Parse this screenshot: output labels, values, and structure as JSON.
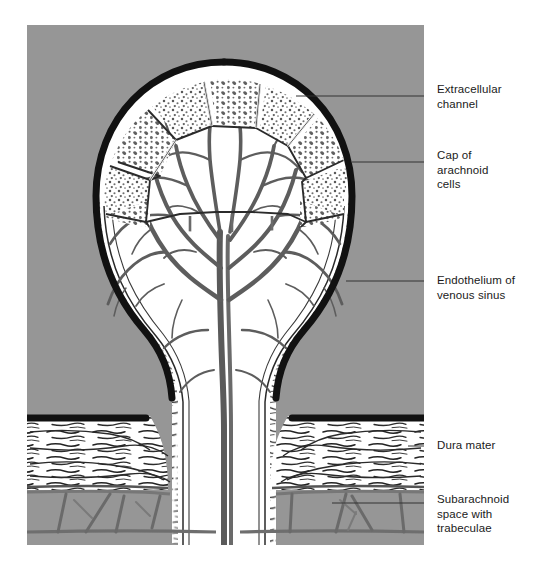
{
  "figure": {
    "panel": {
      "background_color": "#969696",
      "x": 27,
      "y": 25,
      "width": 397,
      "height": 520
    },
    "ink_color": "#1a1a1a",
    "outline_color": "#111111",
    "tissue_color": "#ffffff",
    "hatch_color": "#6b6b6b"
  },
  "labels": [
    {
      "id": "extracellular",
      "text": "Extracellular\nchannel",
      "leader_from_x": 296,
      "leader_y": 96
    },
    {
      "id": "cap",
      "text": "Cap of\narachnoid\ncells",
      "leader_from_x": 352,
      "leader_y": 162
    },
    {
      "id": "endothelium",
      "text": "Endothelium of\nvenous sinus",
      "leader_from_x": 346,
      "leader_y": 281
    },
    {
      "id": "dura",
      "text": "Dura mater",
      "leader_from_x": 408,
      "leader_y": 446
    },
    {
      "id": "subarachnoid",
      "text": "Subarachnoid\nspace with\ntrabeculae",
      "leader_from_x": 332,
      "leader_y": 503
    }
  ],
  "structures": [
    {
      "name": "venous-sinus-lumen",
      "description": "gray field surrounding villus"
    },
    {
      "name": "endothelium-outline",
      "description": "thick black line bounding the villus"
    },
    {
      "name": "arachnoid-cap-cells",
      "description": "polygonal stippled cells at dome apex"
    },
    {
      "name": "arachnoid-trabeculae-core",
      "description": "branching tree-like core of villus"
    },
    {
      "name": "villus-neck",
      "description": "narrow stalk passing through dura"
    },
    {
      "name": "dura-mater",
      "description": "horizontally fibrous band across lower image"
    },
    {
      "name": "subarachnoid-space",
      "description": "open space below dura with trabecular struts"
    },
    {
      "name": "arachnoid-membrane",
      "description": "lower boundary membrane of subarachnoid space"
    }
  ]
}
